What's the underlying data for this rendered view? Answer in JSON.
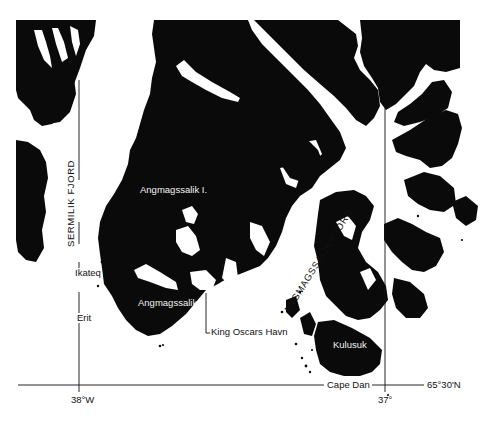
{
  "map": {
    "title": "Angmagssalik region, East Greenland",
    "colors": {
      "land": "#0a0a0a",
      "water": "#ffffff",
      "text_dark": "#111111",
      "text_light": "#f2f2f2"
    },
    "labels": {
      "sermilik_fjord": "SERMILIK FJORD",
      "angmagssalik_fjord": "ANGMAGSSALIK FJORD",
      "angmagssalik_island": "Angmagssalik I.",
      "angmagssalik_town": "Angmagssalik",
      "ikateq": "Ikateq",
      "erit": "Erit",
      "king_oscars_havn": "King Oscars Havn",
      "kulusuk": "Kulusuk",
      "cape_dan": "Cape Dan"
    },
    "graticule": {
      "lon_38": "38°W",
      "lon_37": "37°",
      "lat_65_30": "65°30'N"
    }
  }
}
